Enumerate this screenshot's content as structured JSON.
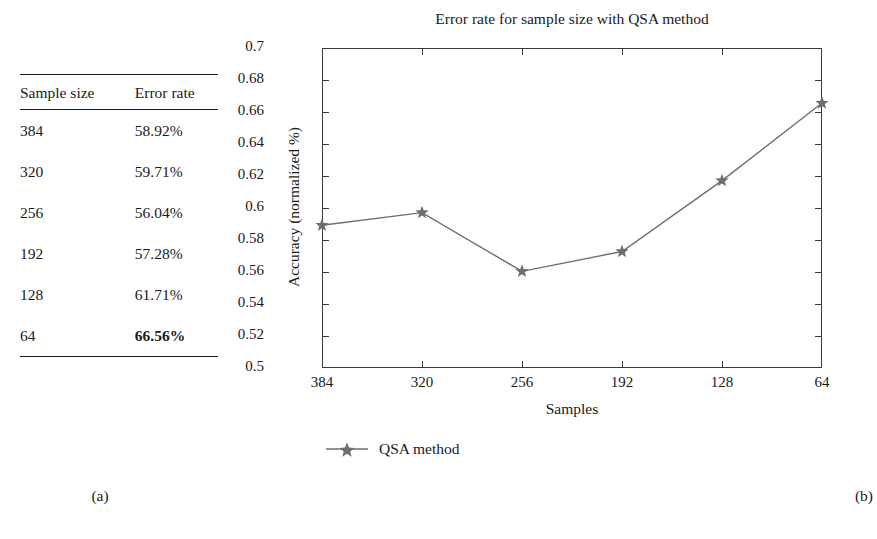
{
  "figure": {
    "panel_a_caption": "(a)",
    "panel_b_caption": "(b)"
  },
  "table": {
    "headers": [
      "Sample size",
      "Error rate"
    ],
    "rows": [
      {
        "sample_size": "384",
        "error_rate": "58.92%",
        "bold": false
      },
      {
        "sample_size": "320",
        "error_rate": "59.71%",
        "bold": false
      },
      {
        "sample_size": "256",
        "error_rate": "56.04%",
        "bold": false
      },
      {
        "sample_size": "192",
        "error_rate": "57.28%",
        "bold": false
      },
      {
        "sample_size": "128",
        "error_rate": "61.71%",
        "bold": false
      },
      {
        "sample_size": "64",
        "error_rate": "66.56%",
        "bold": true
      }
    ]
  },
  "chart_data": {
    "type": "line",
    "title": "Error rate for sample size with QSA method",
    "xlabel": "Samples",
    "ylabel": "Accuracy (normalized %)",
    "categories": [
      "384",
      "320",
      "256",
      "192",
      "128",
      "64"
    ],
    "series": [
      {
        "name": "QSA method",
        "values": [
          0.5892,
          0.5971,
          0.5604,
          0.5728,
          0.6171,
          0.6656
        ],
        "marker": "star",
        "color": "#6e6e6e"
      }
    ],
    "ylim": [
      0.5,
      0.7
    ],
    "ytick_step": 0.02,
    "ytick_labels": [
      "0.7",
      "0.68",
      "0.66",
      "0.64",
      "0.62",
      "0.6",
      "0.58",
      "0.56",
      "0.54",
      "0.52",
      "0.5"
    ],
    "ytick_values": [
      0.7,
      0.68,
      0.66,
      0.64,
      0.62,
      0.6,
      0.58,
      0.56,
      0.54,
      0.52,
      0.5
    ],
    "grid": false,
    "legend_position": "below-left",
    "legend_entries": [
      "QSA method"
    ],
    "axis_color": "#3a3a3a",
    "line_color": "#6e6e6e"
  }
}
